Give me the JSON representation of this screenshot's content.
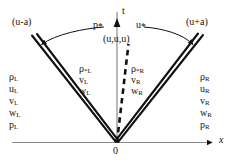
{
  "figure": {
    "kind": "x-t wave structure diagram",
    "axes": {
      "t_label": "t",
      "x_label": "x",
      "origin_label": "0"
    },
    "waves": {
      "left_label": "(u-a)",
      "right_label": "(u+a)",
      "contact_label": "(u,u,u)"
    },
    "star_labels": {
      "pressure": "p",
      "pressure_sub": "*",
      "velocity": "u",
      "velocity_sub": "*"
    },
    "star_left_state": {
      "rho": "ρ",
      "rho_sub": "*L",
      "v": "v",
      "v_sub": "L",
      "w": "w",
      "w_sub": "L"
    },
    "star_right_state": {
      "rho": "ρ",
      "rho_sub": "*R",
      "v": "v",
      "v_sub": "R",
      "w": "w",
      "w_sub": "R"
    },
    "left_state": {
      "items": [
        {
          "sym": "ρ",
          "sub": "L"
        },
        {
          "sym": "u",
          "sub": "L"
        },
        {
          "sym": "v",
          "sub": "L"
        },
        {
          "sym": "w",
          "sub": "L"
        },
        {
          "sym": "p",
          "sub": "L"
        }
      ]
    },
    "right_state": {
      "items": [
        {
          "sym": "ρ",
          "sub": "R"
        },
        {
          "sym": "u",
          "sub": "R"
        },
        {
          "sym": "v",
          "sub": "R"
        },
        {
          "sym": "w",
          "sub": "R"
        },
        {
          "sym": "p",
          "sub": "R"
        }
      ]
    },
    "colors": {
      "ink": "#111111",
      "axis": "#8a8a8a",
      "background": "#ffffff"
    }
  },
  "chart_data": {
    "type": "diagram",
    "title": "",
    "xlabel": "x",
    "ylabel": "t",
    "annotations": [
      "(u-a)",
      "(u+a)",
      "(u,u,u)",
      "p*",
      "u*",
      "0",
      "t",
      "x"
    ],
    "regions": [
      {
        "name": "left",
        "labels": [
          "ρL",
          "uL",
          "vL",
          "wL",
          "pL"
        ]
      },
      {
        "name": "star-left",
        "labels": [
          "ρ*L",
          "vL",
          "wL"
        ]
      },
      {
        "name": "star-right",
        "labels": [
          "ρ*R",
          "vR",
          "wR"
        ]
      },
      {
        "name": "right",
        "labels": [
          "ρR",
          "uR",
          "vR",
          "wR",
          "pR"
        ]
      }
    ]
  }
}
